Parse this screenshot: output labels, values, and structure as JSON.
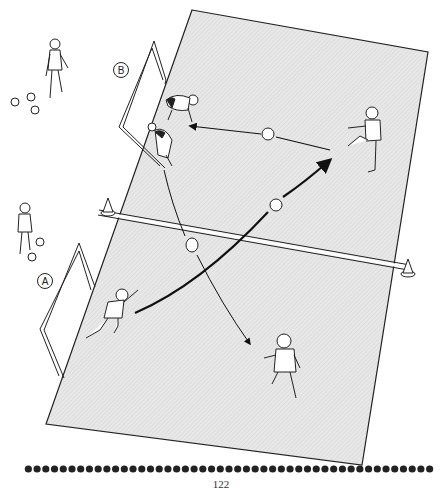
{
  "diagram": {
    "colors": {
      "field_fill": "#e6e6e6",
      "field_stroke": "#222222",
      "line": "#111111",
      "background": "#ffffff",
      "bead": "#222222"
    },
    "field": {
      "corners": [
        [
          192,
          10
        ],
        [
          428,
          52
        ],
        [
          362,
          465
        ],
        [
          46,
          424
        ]
      ],
      "halfway_line": [
        [
          98,
          213
        ],
        [
          408,
          268
        ]
      ]
    },
    "goals": [
      {
        "id": "goal-B",
        "label": "B",
        "label_pos": [
          121,
          70
        ]
      },
      {
        "id": "goal-A",
        "label": "A",
        "label_pos": [
          45,
          281
        ]
      }
    ],
    "cones": [
      {
        "id": "cone-left",
        "pos": [
          108,
          208
        ]
      },
      {
        "id": "cone-right",
        "pos": [
          408,
          268
        ]
      }
    ],
    "balls": [
      {
        "id": "ball-pass-top",
        "pos": [
          268,
          133
        ]
      },
      {
        "id": "ball-long-pass",
        "pos": [
          276,
          205
        ]
      },
      {
        "id": "ball-curve",
        "pos": [
          192,
          244
        ]
      },
      {
        "id": "spare-ball-1",
        "pos": [
          13,
          100
        ]
      },
      {
        "id": "spare-ball-2",
        "pos": [
          30,
          96
        ]
      },
      {
        "id": "spare-ball-3",
        "pos": [
          34,
          108
        ]
      },
      {
        "id": "spare-ball-4",
        "pos": [
          40,
          242
        ]
      },
      {
        "id": "spare-ball-5",
        "pos": [
          32,
          257
        ]
      }
    ],
    "players": [
      {
        "id": "waiting-player-B",
        "role": "waiting player beside goal B",
        "pos": [
          56,
          65
        ]
      },
      {
        "id": "goalkeeper-B-1",
        "role": "crouching player at goal B",
        "pos": [
          183,
          100
        ]
      },
      {
        "id": "goalkeeper-B-2",
        "role": "crouching player at goal B",
        "pos": [
          163,
          140
        ]
      },
      {
        "id": "kicker-right",
        "role": "player kicking",
        "pos": [
          370,
          140
        ]
      },
      {
        "id": "waiting-player-A",
        "role": "waiting player beside goal A",
        "pos": [
          24,
          225
        ]
      },
      {
        "id": "runner-A",
        "role": "player sprinting from goal A",
        "pos": [
          112,
          318
        ]
      },
      {
        "id": "runner-bottom",
        "role": "player running away",
        "pos": [
          285,
          370
        ]
      }
    ],
    "arrows": [
      {
        "id": "pass-arrow-left",
        "description": "thin arrow pointing left from kicker toward goal B",
        "from": [
          330,
          150
        ],
        "to": [
          190,
          127
        ]
      },
      {
        "id": "long-pass-arrow",
        "description": "thick curved arrow from runner A to kicker",
        "from": [
          135,
          313
        ],
        "to": [
          330,
          180
        ]
      },
      {
        "id": "curve-run-arrow",
        "description": "thin curved arrow from goal B down to bottom runner",
        "from": [
          164,
          170
        ],
        "to": [
          250,
          345
        ]
      }
    ],
    "footer": {
      "bead_count": 47,
      "page_number": "122"
    }
  }
}
